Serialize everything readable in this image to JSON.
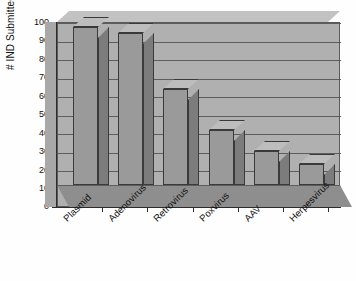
{
  "chart_data": {
    "type": "bar",
    "title": "",
    "xlabel": "",
    "ylabel": "# IND Submitted",
    "ylim": [
      0,
      100
    ],
    "ytick_step": 10,
    "yticks": [
      "0",
      "10",
      "20",
      "30",
      "40",
      "50",
      "60",
      "70",
      "80",
      "90",
      "100"
    ],
    "grid": true,
    "legend": "none",
    "style": "3d-column",
    "categories": [
      "Plasmid",
      "Adenovirus",
      "Retrovirus",
      "Poxvirus",
      "AAV",
      "Herpesvirus"
    ],
    "values": [
      97,
      93,
      59,
      34,
      21,
      13
    ],
    "colors": {
      "bar_front": "#9a9a9a",
      "bar_side": "#7c7c7c",
      "bar_top": "#bdbdbd",
      "wall": "#b0b0b0",
      "floor": "#8e8e8e",
      "axis": "#2c2c2c",
      "gridline": "#4f4f4f",
      "background": "#ffffff"
    }
  }
}
